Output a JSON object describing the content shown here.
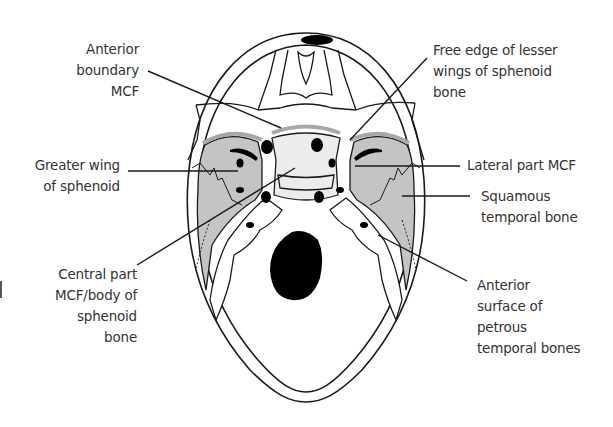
{
  "diagram": {
    "colors": {
      "shaded_region": "#c4c4c4",
      "outline": "#1a1a1a",
      "foramen": "#000000",
      "leader_line": "#1a1a1a",
      "label_text": "#333333",
      "body_highlight": "#ececec"
    },
    "labels": {
      "anterior_boundary": [
        "Anterior",
        "boundary",
        "MCF"
      ],
      "free_edge_lesser_wings": [
        "Free edge of lesser",
        "wings of sphenoid",
        "bone"
      ],
      "greater_wing": [
        "Greater wing",
        "of sphenoid"
      ],
      "lateral_part": [
        "Lateral part MCF"
      ],
      "squamous_temporal": [
        "Squamous",
        "temporal bone"
      ],
      "central_part": [
        "Central part",
        "MCF/body of",
        "sphenoid",
        "bone"
      ],
      "anterior_surface_petrous": [
        "Anterior",
        "surface of",
        "petrous",
        "temporal bones"
      ]
    }
  }
}
